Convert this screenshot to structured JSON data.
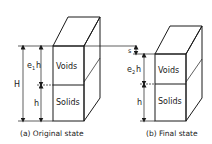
{
  "diagram": {
    "left": {
      "caption": "(a) Original state",
      "top_label": "Voids",
      "bottom_label": "Solids",
      "dim_total": "H",
      "dim_voids_prefix": "e",
      "dim_voids_sub": "1",
      "dim_voids_suffix": "h",
      "dim_solids": "h"
    },
    "right": {
      "caption": "(b) Final state",
      "top_label": "Voids",
      "bottom_label": "Solids",
      "dim_settlement": "s",
      "dim_voids_prefix": "e",
      "dim_voids_sub": "2",
      "dim_voids_suffix": "h",
      "dim_solids": "h"
    },
    "colors": {
      "line": "#1a1a1a",
      "background": "#ffffff"
    }
  }
}
